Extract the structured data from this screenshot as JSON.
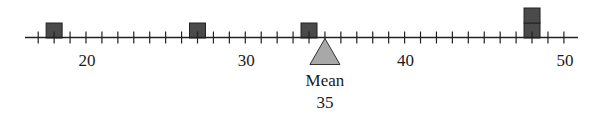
{
  "chart_data": {
    "type": "dot_plot",
    "title": "",
    "xlabel": "",
    "ylabel": "",
    "axis": {
      "min": 17,
      "max": 50,
      "tick_step": 1,
      "labeled_ticks": [
        20,
        30,
        40,
        50
      ]
    },
    "points": [
      18,
      27,
      34,
      48,
      48
    ],
    "stacks": [
      {
        "value": 18,
        "count": 1
      },
      {
        "value": 27,
        "count": 1
      },
      {
        "value": 34,
        "count": 1
      },
      {
        "value": 48,
        "count": 2
      }
    ],
    "mean": {
      "label": "Mean",
      "value": 35
    },
    "colors": {
      "box": "#4a4a4a",
      "box_border": "#222222",
      "fulcrum": "#a8a8a8",
      "axis": "#222222"
    }
  }
}
